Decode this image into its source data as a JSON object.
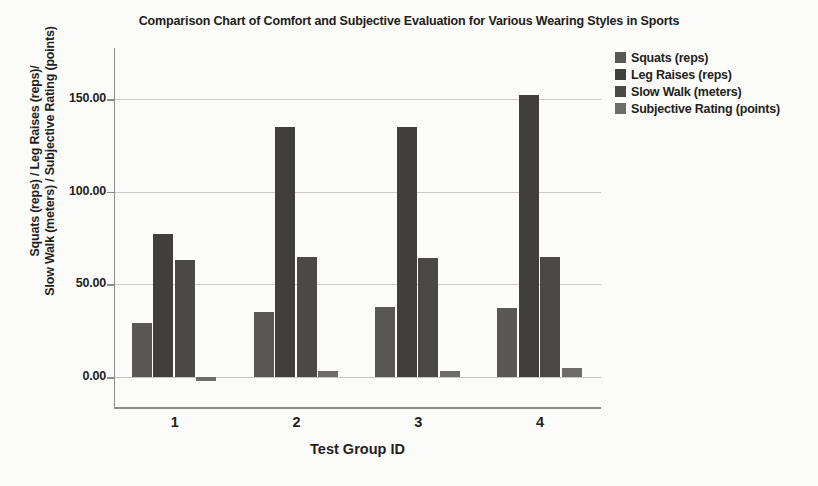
{
  "chart_data": {
    "type": "bar",
    "title": "Comparison Chart of Comfort and Subjective Evaluation for Various Wearing Styles in Sports",
    "xlabel": "Test Group ID",
    "ylabel_line1": "Squats (reps) / Leg Raises (reps)/",
    "ylabel_line2": "Slow Walk (meters) / Subjective Rating (points)",
    "categories": [
      "1",
      "2",
      "3",
      "4"
    ],
    "series": [
      {
        "name": "Squats (reps)",
        "color": "#595855",
        "values": [
          29,
          35,
          38,
          37
        ]
      },
      {
        "name": "Leg Raises (reps)",
        "color": "#403f3d",
        "values": [
          77,
          135,
          135,
          152
        ]
      },
      {
        "name": "Slow Walk (meters)",
        "color": "#4a4947",
        "values": [
          63,
          65,
          64,
          65
        ]
      },
      {
        "name": "Subjective Rating (points)",
        "color": "#6d6c68",
        "values": [
          -2,
          3,
          3,
          5
        ]
      }
    ],
    "ytick_labels": [
      "0.00",
      "50.00",
      "100.00",
      "150.00"
    ],
    "ytick_values": [
      0,
      50,
      100,
      150
    ],
    "ylim": [
      -12,
      168
    ],
    "grid": true,
    "legend_position": "top-right",
    "axis_color": "#8f8b86",
    "grid_color": "#cfcbc6",
    "background": "#fbfbf9"
  }
}
